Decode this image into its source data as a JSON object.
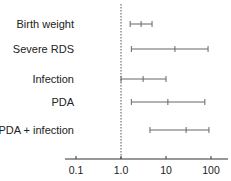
{
  "chart_data": {
    "type": "forest",
    "title": "",
    "xlabel": "",
    "ylabel": "",
    "xscale": "log",
    "xlim": [
      0.05,
      200
    ],
    "reference_line": 1.0,
    "x_ticks": [
      "0.1",
      "1.0",
      "10",
      "100"
    ],
    "x_tick_values": [
      0.1,
      1.0,
      10,
      100
    ],
    "grid": false,
    "categories": [
      "Birth weight",
      "Severe RDS",
      "Infection",
      "PDA",
      "PDA + infection"
    ],
    "series": [
      {
        "name": "odds_ratio",
        "values": [
          2.8,
          15.8,
          3.1,
          11,
          28
        ]
      },
      {
        "name": "ci_lower",
        "values": [
          1.6,
          1.7,
          1.0,
          1.7,
          4.4
        ]
      },
      {
        "name": "ci_upper",
        "values": [
          4.9,
          86,
          10,
          73,
          90
        ]
      }
    ]
  },
  "colors": {
    "ci_line": "#666666",
    "axis": "#333333",
    "reference": "#555555"
  }
}
